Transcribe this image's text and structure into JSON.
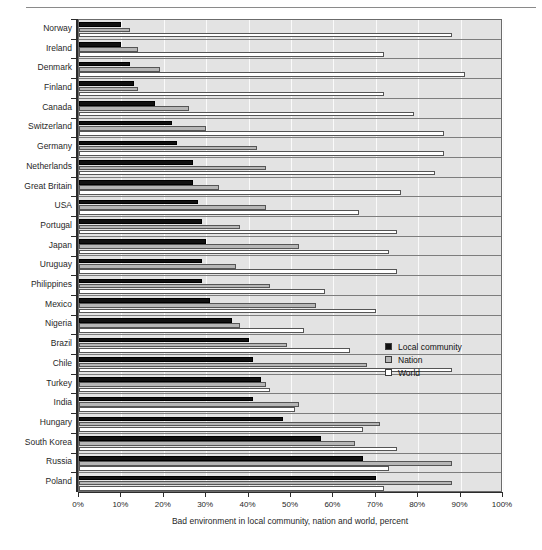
{
  "chart_data": {
    "type": "bar",
    "orientation": "horizontal",
    "title": "",
    "xlabel": "Bad environment in local community, nation and world, percent",
    "ylabel": "",
    "xlim": [
      0,
      100
    ],
    "xticks": [
      "0%",
      "10%",
      "20%",
      "30%",
      "40%",
      "50%",
      "60%",
      "70%",
      "80%",
      "90%",
      "100%"
    ],
    "xtick_values": [
      0,
      10,
      20,
      30,
      40,
      50,
      60,
      70,
      80,
      90,
      100
    ],
    "grid": true,
    "legend_position": "middle-right",
    "categories": [
      "Norway",
      "Ireland",
      "Denmark",
      "Finland",
      "Canada",
      "Switzerland",
      "Germany",
      "Netherlands",
      "Great Britain",
      "USA",
      "Portugal",
      "Japan",
      "Uruguay",
      "Philippines",
      "Mexico",
      "Nigeria",
      "Brazil",
      "Chile",
      "Turkey",
      "India",
      "Hungary",
      "South Korea",
      "Russia",
      "Poland"
    ],
    "series": [
      {
        "name": "Local community",
        "color": "#111111",
        "values": [
          10,
          10,
          12,
          13,
          18,
          22,
          23,
          27,
          27,
          28,
          29,
          30,
          29,
          29,
          31,
          36,
          40,
          41,
          43,
          41,
          48,
          57,
          67,
          70
        ]
      },
      {
        "name": "Nation",
        "color": "#b6b6b6",
        "values": [
          12,
          14,
          19,
          14,
          26,
          30,
          42,
          44,
          33,
          44,
          38,
          52,
          37,
          45,
          56,
          38,
          49,
          68,
          44,
          52,
          71,
          65,
          88,
          88
        ]
      },
      {
        "name": "World",
        "color": "#ffffff",
        "values": [
          88,
          72,
          91,
          72,
          79,
          86,
          86,
          84,
          76,
          66,
          75,
          73,
          75,
          58,
          70,
          53,
          64,
          88,
          45,
          51,
          67,
          75,
          73,
          72
        ]
      }
    ]
  },
  "legend": {
    "items": [
      {
        "label": "Local community",
        "swatch": "sw-local"
      },
      {
        "label": "Nation",
        "swatch": "sw-nation"
      },
      {
        "label": "World",
        "swatch": "sw-world"
      }
    ]
  },
  "colors": {
    "local": "#111111",
    "nation": "#b6b6b6",
    "world": "#ffffff",
    "plot_background": "#e3e3e3",
    "gridline": "#fafafa",
    "axis": "#2b2b2b"
  }
}
